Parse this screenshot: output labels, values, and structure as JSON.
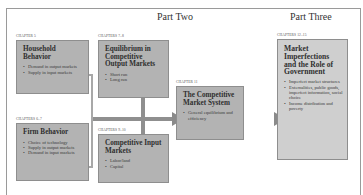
{
  "diagram": {
    "parts": [
      {
        "label": "Part Two"
      },
      {
        "label": "Part Three"
      }
    ],
    "boxes": {
      "household": {
        "chapter": "CHAPTER 5",
        "title": "Household Behavior",
        "bullets": [
          "Demand in output markets",
          "Supply in input markets"
        ]
      },
      "firm": {
        "chapter": "CHAPTERS 6–7",
        "title": "Firm Behavior",
        "bullets": [
          "Choice of technology",
          "Supply in output markets",
          "Demand in input markets"
        ]
      },
      "output_markets": {
        "chapter": "CHAPTERS 7–8",
        "title": "Equilibrium in Competitive Output Markets",
        "bullets": [
          "Short run",
          "Long run"
        ]
      },
      "input_markets": {
        "chapter": "CHAPTERS 9–10",
        "title": "Competitive Input Markets",
        "bullets": [
          "Labor/land",
          "Capital"
        ]
      },
      "market_system": {
        "chapter": "CHAPTER 11",
        "title": "The Competitive Market System",
        "bullets": [
          "General equilibrium and efficiency"
        ]
      },
      "imperfections": {
        "chapter": "CHAPTERS 12–15",
        "title": "Market Imperfections and the Role of Government",
        "bullets": [
          "Imperfect market structures",
          "Externalities, public goods, imperfect information, social choice",
          "Income distribution and poverty"
        ]
      }
    },
    "colors": {
      "box_fill": "#b3b3b3",
      "box_fill_light": "#cfcfcf",
      "connector": "#8f8f8f",
      "frame": "#9a9a9a"
    }
  }
}
